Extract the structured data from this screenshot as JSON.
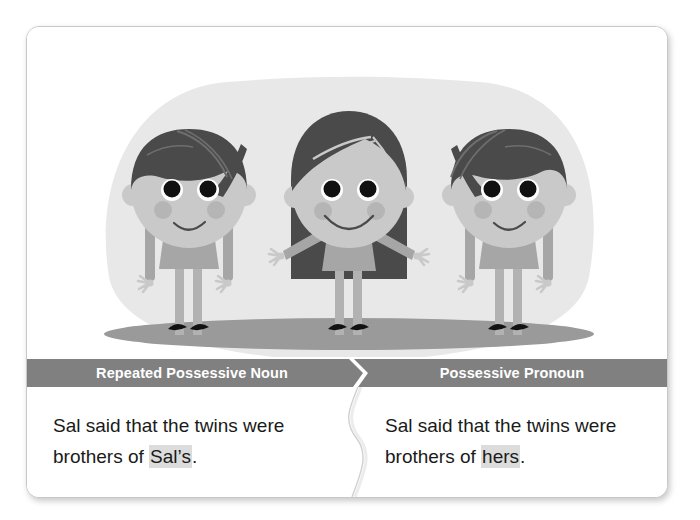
{
  "card": {
    "illustration": {
      "name": "three-children-illustration",
      "description": "Three cartoon children standing side by side on a gray ground ellipse",
      "figures": [
        {
          "name": "left-child",
          "hair": "short-bob",
          "pose": "arms-down"
        },
        {
          "name": "middle-child",
          "hair": "long-hair",
          "pose": "arms-out"
        },
        {
          "name": "right-child",
          "hair": "short-bob",
          "pose": "arms-down"
        }
      ],
      "colors": {
        "backdrop": "#e8e8e8",
        "ground": "#9a9a9a",
        "skin": "#c9c9c9",
        "hair": "#4a4a4a",
        "hair_light": "#6e6e6e",
        "clothes": "#a6a6a6",
        "cheek": "#b5b5b5",
        "eye": "#111111",
        "shoe": "#121212"
      }
    },
    "columns": [
      {
        "header": "Repeated Possessive Noun",
        "line1": "Sal said that the twins were",
        "line2_prefix": "brothers of ",
        "line2_highlight": "Sal’s",
        "line2_suffix": "."
      },
      {
        "header": "Possessive Pronoun",
        "line1": "Sal said that the twins were",
        "line2_prefix": "brothers of ",
        "line2_highlight": "hers",
        "line2_suffix": "."
      }
    ],
    "theme": {
      "header_bg": "#808080",
      "header_text": "#ffffff",
      "body_bg": "#ffffff",
      "body_text": "#1a1a1a",
      "highlight_bg": "#dcdcdc",
      "card_border": "#c8c8c8"
    }
  }
}
